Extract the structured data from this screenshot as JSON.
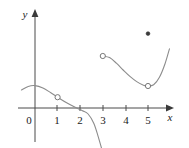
{
  "figure": {
    "width": 189,
    "height": 148,
    "background_color": "#ffffff"
  },
  "chart_data": {
    "type": "line",
    "title": "",
    "xlabel": "x",
    "ylabel": "y",
    "xlim": [
      -0.65,
      5.95
    ],
    "ylim": [
      -1.2,
      2.1
    ],
    "grid": false,
    "legend": null,
    "axis_color": "#4a4a4a",
    "curve_color": "#8c8c8c",
    "label_color": "#1a1a1a",
    "x_ticks": [
      0,
      1,
      2,
      3,
      4,
      5
    ],
    "x_tick_labels": [
      "0",
      "1",
      "2",
      "3",
      "4",
      "5"
    ],
    "y_ticks": [],
    "y_tick_labels": [],
    "origin_label": "0",
    "series": [
      {
        "name": "left-branch",
        "comment": "decreasing curve from left edge through (1, 0.6) crossing axis near x=2.4 down to (3, -1.1)",
        "points": [
          [
            -0.6,
            0.45
          ],
          [
            -0.3,
            0.54
          ],
          [
            0.0,
            0.56
          ],
          [
            0.35,
            0.5
          ],
          [
            0.7,
            0.38
          ],
          [
            1.0,
            0.27
          ],
          [
            1.4,
            0.13
          ],
          [
            1.8,
            0.01
          ],
          [
            2.1,
            -0.07
          ],
          [
            2.35,
            -0.15
          ],
          [
            2.6,
            -0.38
          ],
          [
            2.8,
            -0.72
          ],
          [
            3.0,
            -1.12
          ]
        ]
      },
      {
        "name": "right-branch",
        "comment": "curve from (3, 1.3) dipping to minimum near (5, 0.55) then rising to (6, 1.5)",
        "points": [
          [
            3.0,
            1.3
          ],
          [
            3.3,
            1.26
          ],
          [
            3.6,
            1.12
          ],
          [
            3.9,
            0.95
          ],
          [
            4.2,
            0.79
          ],
          [
            4.5,
            0.66
          ],
          [
            4.8,
            0.57
          ],
          [
            5.0,
            0.55
          ],
          [
            5.25,
            0.58
          ],
          [
            5.5,
            0.76
          ],
          [
            5.75,
            1.1
          ],
          [
            5.95,
            1.48
          ]
        ]
      }
    ],
    "markers": [
      {
        "name": "open-point-left-branch",
        "style": "open",
        "x": 1.0,
        "y": 0.27
      },
      {
        "name": "closed-endpoint-left-branch",
        "style": "closed",
        "x": 3.0,
        "y": -1.12
      },
      {
        "name": "open-endpoint-right-branch-start",
        "style": "open",
        "x": 3.0,
        "y": 1.3
      },
      {
        "name": "open-point-right-branch-minimum",
        "style": "open",
        "x": 5.0,
        "y": 0.55
      },
      {
        "name": "isolated-closed-point",
        "style": "closed",
        "x": 5.0,
        "y": 1.86
      }
    ]
  }
}
